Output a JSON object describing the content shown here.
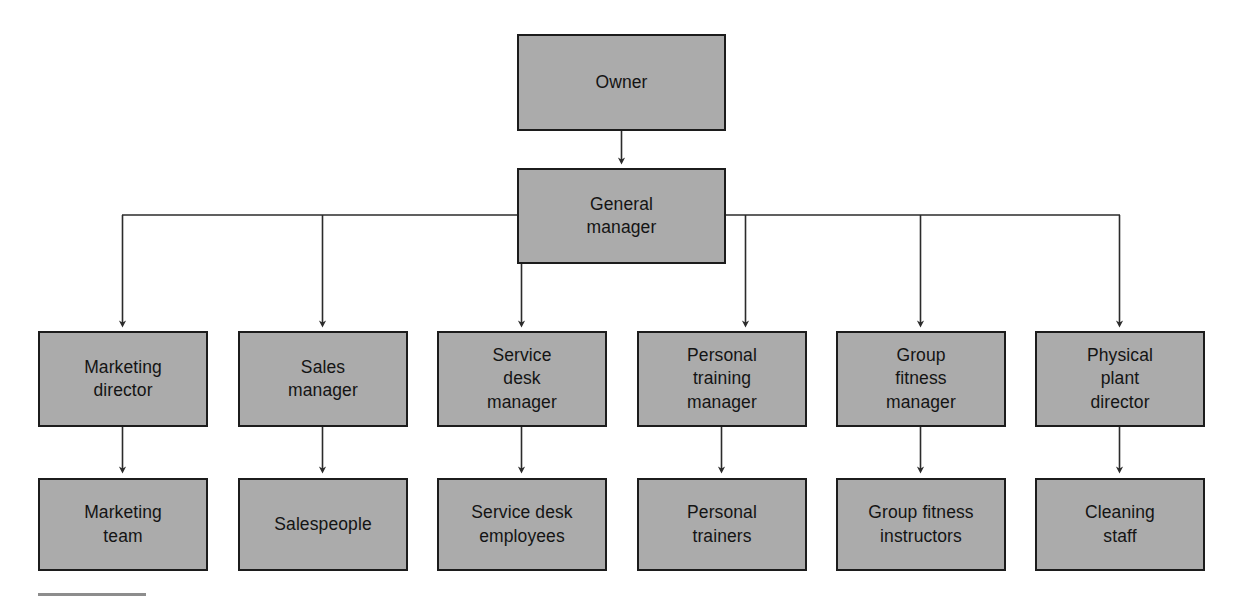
{
  "chart": {
    "type": "org-chart",
    "background_color": "#ffffff",
    "node_fill_color": "#ababab",
    "node_border_color": "#1c1c1c",
    "text_color": "#141414",
    "connector_color": "#2b2b2b",
    "footer_rule_color": "#8d8d8d"
  },
  "nodes": {
    "owner": {
      "label": "Owner",
      "level": 1
    },
    "general_manager": {
      "label": "General\nmanager",
      "level": 2
    },
    "marketing_director": {
      "label": "Marketing\ndirector",
      "level": 3
    },
    "sales_manager": {
      "label": "Sales\nmanager",
      "level": 3
    },
    "service_desk_manager": {
      "label": "Service\ndesk\nmanager",
      "level": 3
    },
    "personal_training_manager": {
      "label": "Personal\ntraining\nmanager",
      "level": 3
    },
    "group_fitness_manager": {
      "label": "Group\nfitness\nmanager",
      "level": 3
    },
    "physical_plant_director": {
      "label": "Physical\nplant\ndirector",
      "level": 3
    },
    "marketing_team": {
      "label": "Marketing\nteam",
      "level": 4
    },
    "salespeople": {
      "label": "Salespeople",
      "level": 4
    },
    "service_desk_employees": {
      "label": "Service desk\nemployees",
      "level": 4
    },
    "personal_trainers": {
      "label": "Personal\ntrainers",
      "level": 4
    },
    "group_fitness_instructors": {
      "label": "Group fitness\ninstructors",
      "level": 4
    },
    "cleaning_staff": {
      "label": "Cleaning\nstaff",
      "level": 4
    }
  },
  "edges": [
    {
      "from": "owner",
      "to": "general_manager",
      "style": "arrow-down"
    },
    {
      "from": "general_manager",
      "to": "marketing_director",
      "style": "elbow-arrow"
    },
    {
      "from": "general_manager",
      "to": "sales_manager",
      "style": "elbow-arrow"
    },
    {
      "from": "general_manager",
      "to": "service_desk_manager",
      "style": "elbow-arrow"
    },
    {
      "from": "general_manager",
      "to": "personal_training_manager",
      "style": "elbow-arrow"
    },
    {
      "from": "general_manager",
      "to": "group_fitness_manager",
      "style": "elbow-arrow"
    },
    {
      "from": "general_manager",
      "to": "physical_plant_director",
      "style": "elbow-arrow"
    },
    {
      "from": "marketing_director",
      "to": "marketing_team",
      "style": "arrow-down"
    },
    {
      "from": "sales_manager",
      "to": "salespeople",
      "style": "arrow-down"
    },
    {
      "from": "service_desk_manager",
      "to": "service_desk_employees",
      "style": "arrow-down"
    },
    {
      "from": "personal_training_manager",
      "to": "personal_trainers",
      "style": "arrow-down"
    },
    {
      "from": "group_fitness_manager",
      "to": "group_fitness_instructors",
      "style": "arrow-down"
    },
    {
      "from": "physical_plant_director",
      "to": "cleaning_staff",
      "style": "arrow-down"
    }
  ]
}
